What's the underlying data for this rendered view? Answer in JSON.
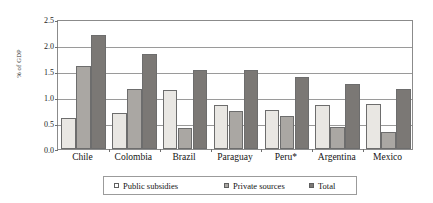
{
  "chart_data": {
    "type": "bar",
    "title": "",
    "xlabel": "",
    "ylabel": "% of GDP",
    "ylim": [
      0.0,
      2.5
    ],
    "ytick_labels": [
      "0.0",
      "0.5",
      "1.0",
      "1.5",
      "2.0",
      "2.5"
    ],
    "ytick_values": [
      0.0,
      0.5,
      1.0,
      1.5,
      2.0,
      2.5
    ],
    "grid": true,
    "legend_position": "bottom",
    "categories": [
      "Chile",
      "Colombia",
      "Brazil",
      "Paraguay",
      "Peru*",
      "Argentina",
      "Mexico"
    ],
    "series": [
      {
        "name": "Public subsidies",
        "color": "#e9e7e3",
        "values": [
          0.6,
          0.7,
          1.13,
          0.84,
          0.75,
          0.85,
          0.86
        ]
      },
      {
        "name": "Private sources",
        "color": "#aaa7a3",
        "values": [
          1.6,
          1.15,
          0.4,
          0.73,
          0.63,
          0.42,
          0.32
        ]
      },
      {
        "name": "Total",
        "color": "#7b7875",
        "values": [
          2.2,
          1.82,
          1.52,
          1.52,
          1.38,
          1.25,
          1.15
        ]
      }
    ]
  },
  "legend": {
    "items": [
      {
        "label": "Public subsidies"
      },
      {
        "label": "Private sources"
      },
      {
        "label": "Total"
      }
    ]
  }
}
